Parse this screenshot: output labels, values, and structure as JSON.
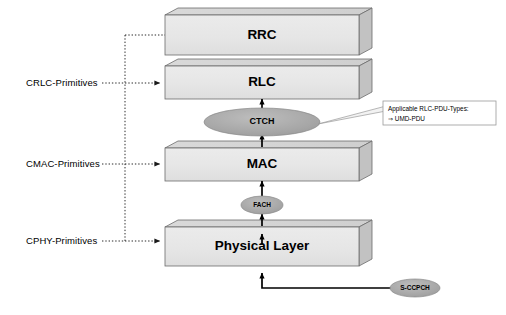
{
  "diagram": {
    "colors": {
      "box_front": "#e8e8e8",
      "box_top": "#d4d4d4",
      "box_side": "#c4c4c4",
      "box_stroke": "#6b6b6b",
      "ellipse_fill": "#a8a8a8",
      "ellipse_stroke": "#6b6b6b",
      "arrow": "#000000",
      "dotted": "#3a3a3a",
      "callout_bg": "#ffffff",
      "callout_stroke": "#9a9a9a",
      "text": "#000000"
    },
    "layers": [
      {
        "id": "rrc",
        "label": "RRC"
      },
      {
        "id": "rlc",
        "label": "RLC"
      },
      {
        "id": "mac",
        "label": "MAC"
      },
      {
        "id": "phy",
        "label": "Physical Layer"
      }
    ],
    "primitives": [
      {
        "id": "crlc",
        "label": "CRLC-Primitives",
        "target": "RLC"
      },
      {
        "id": "cmac",
        "label": "CMAC-Primitives",
        "target": "MAC"
      },
      {
        "id": "cphy",
        "label": "CPHY-Primitives",
        "target": "Physical Layer"
      }
    ],
    "channels": [
      {
        "id": "ctch",
        "label": "CTCH",
        "kind": "logical-channel"
      },
      {
        "id": "fach",
        "label": "FACH",
        "kind": "transport-channel"
      },
      {
        "id": "sccpch",
        "label": "S-CCPCH",
        "kind": "physical-channel"
      }
    ],
    "callout": {
      "line1": "Applicable RLC-PDU-Types:",
      "line2": "⇒ UMD-PDU",
      "anchor": "ctch"
    }
  }
}
